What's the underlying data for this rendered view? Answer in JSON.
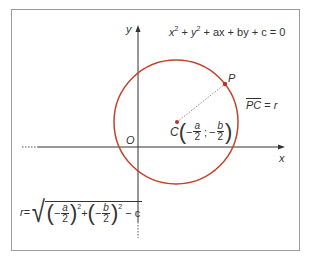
{
  "diagram": {
    "title_equation": {
      "parts": [
        "x",
        "2",
        " + ",
        "y",
        "2",
        " + ax + by + c = 0"
      ],
      "text": "x² + y² + ax + by + c = 0"
    },
    "axes": {
      "x_label": "x",
      "y_label": "y",
      "origin_label": "O"
    },
    "point_P": {
      "label": "P"
    },
    "center": {
      "label": "C",
      "x_num": "a",
      "x_den": "2",
      "y_num": "b",
      "y_den": "2",
      "minus": "−",
      "separator": ";",
      "text": "C(−a/2 ; −b/2)"
    },
    "radius_relation": {
      "segment": "PC",
      "equals": " = ",
      "r": "r",
      "text": "PC = r"
    },
    "radius_formula": {
      "r": "r",
      "equals": "=",
      "a_num": "a",
      "a_den": "2",
      "b_num": "b",
      "b_den": "2",
      "exp": "2",
      "minus": "−",
      "plus": "+",
      "tail": " − c",
      "text": "r = √((−a/2)² + (−b/2)² − c)"
    },
    "colors": {
      "circle": "#c0442a",
      "axes": "#333333",
      "frame": "#9a9a9a",
      "radius_segment": "#888888",
      "points": "#c0302a"
    }
  }
}
